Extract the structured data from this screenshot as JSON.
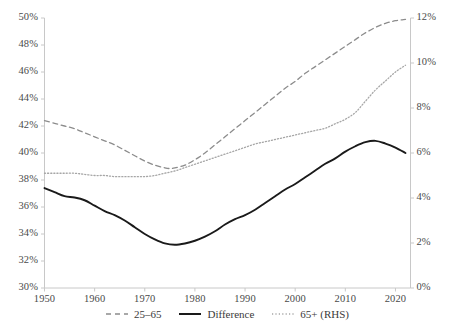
{
  "chart_data": {
    "type": "line",
    "title": "",
    "subtitle": "",
    "xlabel": "",
    "ylabel": "",
    "y2label": "",
    "grid": false,
    "legend_position": "bottom",
    "xlim": [
      1950,
      2023
    ],
    "ylim": [
      30,
      50
    ],
    "y2lim": [
      0,
      12
    ],
    "x_ticks": [
      "1950",
      "1960",
      "1970",
      "1980",
      "1990",
      "2000",
      "2010",
      "2020"
    ],
    "x_tick_values": [
      1950,
      1960,
      1970,
      1980,
      1990,
      2000,
      2010,
      2020
    ],
    "y_left_ticks": [
      "30%",
      "32%",
      "34%",
      "36%",
      "38%",
      "40%",
      "42%",
      "44%",
      "46%",
      "48%",
      "50%"
    ],
    "y_left_tick_values": [
      30,
      32,
      34,
      36,
      38,
      40,
      42,
      44,
      46,
      48,
      50
    ],
    "y_right_ticks": [
      "0%",
      "2%",
      "4%",
      "6%",
      "8%",
      "10%",
      "12%"
    ],
    "y_right_tick_values": [
      0,
      2,
      4,
      6,
      8,
      10,
      12
    ],
    "series": [
      {
        "name": "25–65",
        "axis": "left",
        "style": "dashed",
        "color": "#8c8c8c",
        "x": [
          1950,
          1952,
          1954,
          1956,
          1958,
          1960,
          1962,
          1964,
          1966,
          1968,
          1970,
          1972,
          1974,
          1975,
          1976,
          1978,
          1980,
          1982,
          1984,
          1986,
          1988,
          1990,
          1992,
          1994,
          1996,
          1998,
          2000,
          2002,
          2004,
          2006,
          2008,
          2010,
          2012,
          2014,
          2016,
          2018,
          2020,
          2022
        ],
        "values": [
          42.4,
          42.2,
          42.0,
          41.8,
          41.5,
          41.2,
          40.9,
          40.6,
          40.2,
          39.8,
          39.4,
          39.1,
          38.9,
          38.85,
          38.9,
          39.1,
          39.5,
          40.0,
          40.6,
          41.2,
          41.8,
          42.4,
          43.0,
          43.6,
          44.2,
          44.8,
          45.3,
          45.9,
          46.4,
          46.9,
          47.4,
          47.9,
          48.4,
          48.9,
          49.3,
          49.6,
          49.8,
          49.9
        ]
      },
      {
        "name": "Difference",
        "axis": "left",
        "style": "solid",
        "color": "#1a1a1a",
        "x": [
          1950,
          1952,
          1954,
          1956,
          1958,
          1960,
          1962,
          1964,
          1966,
          1968,
          1970,
          1972,
          1974,
          1976,
          1978,
          1980,
          1982,
          1984,
          1986,
          1988,
          1990,
          1992,
          1994,
          1996,
          1998,
          2000,
          2002,
          2004,
          2006,
          2008,
          2010,
          2012,
          2014,
          2016,
          2018,
          2020,
          2022
        ],
        "values": [
          37.4,
          37.1,
          36.8,
          36.7,
          36.5,
          36.1,
          35.7,
          35.4,
          35.0,
          34.5,
          34.0,
          33.6,
          33.3,
          33.2,
          33.3,
          33.5,
          33.8,
          34.2,
          34.7,
          35.1,
          35.4,
          35.8,
          36.3,
          36.8,
          37.3,
          37.7,
          38.2,
          38.7,
          39.2,
          39.6,
          40.1,
          40.5,
          40.8,
          40.9,
          40.7,
          40.4,
          40.0
        ]
      },
      {
        "name": "65+ (RHS)",
        "axis": "right",
        "style": "dotted",
        "color": "#a6a6a6",
        "x": [
          1950,
          1952,
          1954,
          1956,
          1958,
          1960,
          1962,
          1964,
          1966,
          1968,
          1970,
          1972,
          1974,
          1976,
          1978,
          1980,
          1982,
          1984,
          1986,
          1988,
          1990,
          1992,
          1994,
          1996,
          1998,
          2000,
          2002,
          2004,
          2006,
          2008,
          2010,
          2012,
          2014,
          2016,
          2018,
          2020,
          2022
        ],
        "values": [
          5.1,
          5.1,
          5.1,
          5.1,
          5.05,
          5.0,
          5.0,
          4.95,
          4.95,
          4.95,
          4.95,
          5.0,
          5.1,
          5.2,
          5.35,
          5.5,
          5.65,
          5.8,
          5.95,
          6.1,
          6.25,
          6.4,
          6.5,
          6.6,
          6.7,
          6.8,
          6.9,
          7.0,
          7.1,
          7.3,
          7.5,
          7.8,
          8.3,
          8.8,
          9.2,
          9.6,
          9.9
        ]
      }
    ],
    "legend": [
      {
        "label": "25–65",
        "style": "dashed",
        "color": "#8c8c8c"
      },
      {
        "label": "Difference",
        "style": "solid",
        "color": "#1a1a1a"
      },
      {
        "label": "65+ (RHS)",
        "style": "dotted",
        "color": "#a6a6a6"
      }
    ],
    "axis_color": "#c8c8c8"
  }
}
